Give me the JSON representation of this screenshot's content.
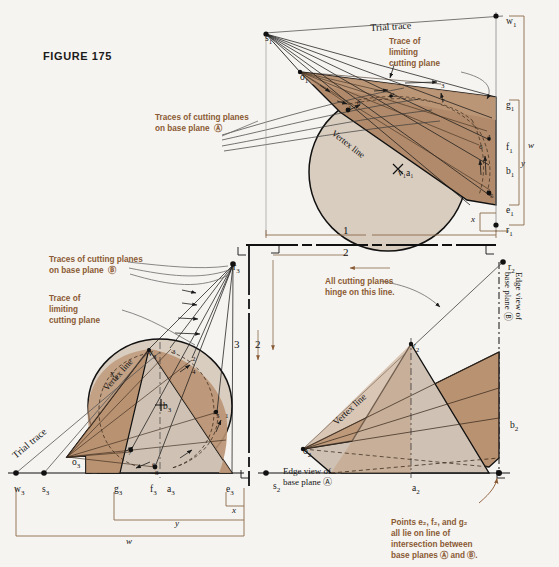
{
  "figure": {
    "title": "FIGURE 175"
  },
  "colors": {
    "background": "#f6f4f0",
    "cone_dark": "#b08a6a",
    "cone_mid": "#c3a184",
    "cone_light": "#d9cdc0",
    "cone_pale": "#cfc2b4",
    "annotation_brown": "#8a5a34",
    "line_black": "#111111",
    "thin_gray": "#6b6b6b",
    "fold_line": "#111111",
    "bracket_brown": "#8a6a4a"
  },
  "annotations": {
    "traces_a": "Traces of cutting planes\non base plane  Ⓐ",
    "traces_b": "Traces of cutting planes\non base plane  Ⓑ",
    "limiting_top": "Trace of\nlimiting\ncutting plane",
    "limiting_left": "Trace of\nlimiting\ncutting plane",
    "hinge": "All cutting planes\nhinge on this line.",
    "points_note": "Points e₂, f₂, and g₂\nall lie on line of\nintersection between\nbase planes Ⓐ and Ⓑ.",
    "edge_view_a": "Edge view of\nbase plane Ⓐ",
    "edge_view_b": "Edge view of\nbase plane Ⓑ",
    "trial_trace_top": "Trial trace",
    "trial_trace_left": "Trial trace",
    "vertex_line_top": "Vertex line",
    "vertex_line_left": "Vertex line",
    "vertex_line_front": "Vertex line"
  },
  "view_labels": {
    "fold_1_2_top": "1",
    "fold_1_2_bottom": "2",
    "fold_3_left": "3",
    "fold_2_right": "2"
  },
  "points": {
    "top_view": [
      {
        "id": "s1",
        "label": "s",
        "sub": "1",
        "x": 265,
        "y": 33
      },
      {
        "id": "o1",
        "label": "o",
        "sub": "1",
        "x": 300,
        "y": 72
      },
      {
        "id": "w1",
        "label": "w",
        "sub": "1",
        "x": 506,
        "y": 16
      },
      {
        "id": "g1",
        "label": "g",
        "sub": "1",
        "x": 506,
        "y": 100
      },
      {
        "id": "f1",
        "label": "f",
        "sub": "1",
        "x": 506,
        "y": 142
      },
      {
        "id": "b1",
        "label": "b",
        "sub": "1",
        "x": 506,
        "y": 166
      },
      {
        "id": "e1",
        "label": "e",
        "sub": "1",
        "x": 506,
        "y": 205
      },
      {
        "id": "r1",
        "label": "r",
        "sub": "1",
        "x": 506,
        "y": 225
      },
      {
        "id": "v1a1",
        "label": "v₁a₁",
        "sub": "",
        "x": 398,
        "y": 168
      }
    ],
    "aux_view": [
      {
        "id": "r3",
        "label": "r",
        "sub": "3",
        "x": 233,
        "y": 262
      },
      {
        "id": "v3",
        "label": "v",
        "sub": "3",
        "x": 148,
        "y": 348
      },
      {
        "id": "b3",
        "label": "b",
        "sub": "3",
        "x": 163,
        "y": 401
      },
      {
        "id": "x3",
        "label": "x",
        "sub": "3",
        "x": 110,
        "y": 369
      },
      {
        "id": "o3",
        "label": "o",
        "sub": "3",
        "x": 72,
        "y": 457
      },
      {
        "id": "w3",
        "label": "w",
        "sub": "3",
        "x": 14,
        "y": 484
      },
      {
        "id": "s3",
        "label": "s",
        "sub": "3",
        "x": 42,
        "y": 484
      },
      {
        "id": "g3",
        "label": "g",
        "sub": "3",
        "x": 114,
        "y": 484
      },
      {
        "id": "f3",
        "label": "f",
        "sub": "3",
        "x": 150,
        "y": 484
      },
      {
        "id": "a3",
        "label": "a",
        "sub": "3",
        "x": 167,
        "y": 484
      },
      {
        "id": "e3",
        "label": "e",
        "sub": "3",
        "x": 226,
        "y": 484
      }
    ],
    "front_view": [
      {
        "id": "r2",
        "label": "r",
        "sub": "2",
        "x": 508,
        "y": 262
      },
      {
        "id": "v2",
        "label": "v",
        "sub": "2",
        "x": 411,
        "y": 341
      },
      {
        "id": "b2",
        "label": "b",
        "sub": "2",
        "x": 510,
        "y": 420
      },
      {
        "id": "o2",
        "label": "o",
        "sub": "2",
        "x": 303,
        "y": 446
      },
      {
        "id": "s2",
        "label": "s",
        "sub": "2",
        "x": 273,
        "y": 481
      },
      {
        "id": "a2",
        "label": "a",
        "sub": "2",
        "x": 412,
        "y": 483
      }
    ]
  },
  "element_numbers": {
    "top_view": [
      {
        "n": "1",
        "x": 348,
        "y": 104
      },
      {
        "n": "2",
        "x": 391,
        "y": 91
      },
      {
        "n": "3",
        "x": 441,
        "y": 82
      },
      {
        "n": "4",
        "x": 487,
        "y": 133
      },
      {
        "n": "5",
        "x": 490,
        "y": 192
      },
      {
        "n": "6",
        "x": 479,
        "y": 143
      },
      {
        "n": "7",
        "x": 441,
        "y": 97
      },
      {
        "n": "8",
        "x": 357,
        "y": 99
      }
    ],
    "aux_view": [
      {
        "n": "1",
        "x": 225,
        "y": 412
      },
      {
        "n": "2",
        "x": 192,
        "y": 355
      },
      {
        "n": "3",
        "x": 172,
        "y": 348
      },
      {
        "n": "4",
        "x": 192,
        "y": 368
      },
      {
        "n": "5",
        "x": 216,
        "y": 412
      },
      {
        "n": "6",
        "x": 152,
        "y": 461
      },
      {
        "n": "7",
        "x": 128,
        "y": 449
      },
      {
        "n": "8",
        "x": 155,
        "y": 469
      }
    ]
  },
  "dimensions": {
    "top_view": [
      {
        "id": "w",
        "label": "w"
      },
      {
        "id": "y",
        "label": "y"
      },
      {
        "id": "x",
        "label": "x"
      }
    ],
    "aux_view": [
      {
        "id": "w",
        "label": "w"
      },
      {
        "id": "y",
        "label": "y"
      },
      {
        "id": "x",
        "label": "x"
      }
    ],
    "top_width": {
      "id": "l",
      "label": "1"
    }
  }
}
